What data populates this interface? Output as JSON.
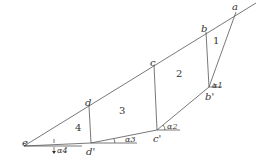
{
  "diagram": {
    "points": {
      "a": "a",
      "b": "b",
      "c": "c",
      "d": "d",
      "e": "e",
      "b_prime": "b'",
      "c_prime": "c'",
      "d_prime": "d'"
    },
    "regions": [
      "1",
      "2",
      "3",
      "4"
    ],
    "angles": [
      "α1",
      "α2",
      "α3",
      "α4"
    ]
  }
}
